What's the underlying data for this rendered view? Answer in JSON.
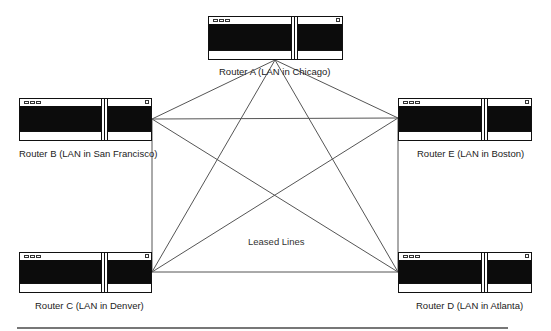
{
  "diagram": {
    "center_label": "Leased Lines",
    "colors": {
      "line": "#555555",
      "router_border": "#111111",
      "router_screen": "#0c0c0c",
      "rule": "#777777"
    },
    "routers": [
      {
        "id": "A",
        "label": "Router A (LAN in Chicago)",
        "box": [
          208,
          16,
          135,
          44
        ],
        "divider_x": 82,
        "label_pos": [
          219,
          66
        ],
        "anchor": [
          275,
          60
        ]
      },
      {
        "id": "B",
        "label": "Router B (LAN in San Francisco)",
        "box": [
          19,
          98,
          133,
          43
        ],
        "divider_x": 82,
        "label_pos": [
          19,
          148
        ],
        "anchor": [
          152,
          119
        ]
      },
      {
        "id": "E",
        "label": "Router E (LAN in Boston)",
        "box": [
          398,
          98,
          134,
          43
        ],
        "divider_x": 82,
        "label_pos": [
          417,
          148
        ],
        "anchor": [
          398,
          118
        ]
      },
      {
        "id": "C",
        "label": "Router C (LAN in Denver)",
        "box": [
          19,
          252,
          133,
          41
        ],
        "divider_x": 82,
        "label_pos": [
          35,
          300
        ],
        "anchor": [
          152,
          272
        ]
      },
      {
        "id": "D",
        "label": "Router D (LAN in Atlanta)",
        "box": [
          398,
          252,
          134,
          41
        ],
        "divider_x": 82,
        "label_pos": [
          416,
          300
        ],
        "anchor": [
          398,
          272
        ]
      }
    ],
    "links": [
      [
        "A",
        "B"
      ],
      [
        "A",
        "C"
      ],
      [
        "A",
        "D"
      ],
      [
        "A",
        "E"
      ],
      [
        "B",
        "E"
      ],
      [
        "B",
        "D"
      ],
      [
        "B",
        "C"
      ],
      [
        "C",
        "E"
      ],
      [
        "C",
        "D"
      ],
      [
        "E",
        "D"
      ]
    ]
  }
}
